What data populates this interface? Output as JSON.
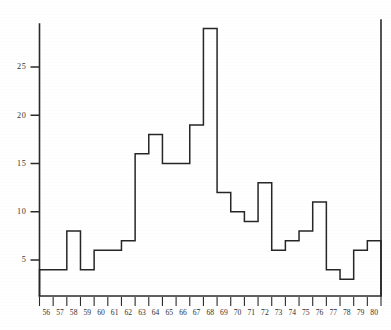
{
  "chart_data": {
    "type": "bar",
    "title": "",
    "subtitle": "",
    "xlabel": "",
    "ylabel": "",
    "grid": false,
    "legend": "none",
    "style": "step-histogram",
    "categories": [
      "56",
      "57",
      "58",
      "59",
      "60",
      "61",
      "62",
      "63",
      "64",
      "65",
      "66",
      "67",
      "68",
      "69",
      "70",
      "71",
      "72",
      "73",
      "74",
      "75",
      "76",
      "77",
      "78",
      "79",
      "80"
    ],
    "values": [
      4,
      4,
      8,
      4,
      6,
      6,
      7,
      16,
      18,
      15,
      15,
      19,
      29,
      12,
      10,
      9,
      13,
      6,
      7,
      8,
      11,
      4,
      3,
      6,
      7
    ],
    "xlim": [
      56,
      81
    ],
    "ylim": [
      0,
      30
    ],
    "yticks": [
      5,
      10,
      15,
      20,
      25
    ],
    "ytick_labels": [
      "5",
      "10",
      "15",
      "20",
      "25"
    ],
    "xtick_labels": [
      "56",
      "57",
      "58",
      "59",
      "60",
      "61",
      "62",
      "63",
      "64",
      "65",
      "66",
      "67",
      "68",
      "69",
      "70",
      "71",
      "72",
      "73",
      "74",
      "75",
      "76",
      "77",
      "78",
      "79",
      "80"
    ],
    "annotations": [],
    "colors": {
      "line": "#262626",
      "axis": "#2a2a2a",
      "background": "#ffffff",
      "label": "#2e2e2e"
    }
  },
  "figure": {
    "caption": "",
    "axis_name_y": "y-axis",
    "axis_name_x": "x-axis"
  }
}
